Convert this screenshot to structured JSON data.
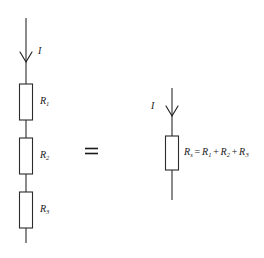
{
  "figure": {
    "ink_color": "#1a1a1a",
    "line_color": "#2b2b2b",
    "background": "#ffffff"
  },
  "left_circuit": {
    "current_label": "I",
    "resistors": [
      {
        "symbol": "R",
        "subscript": "1"
      },
      {
        "symbol": "R",
        "subscript": "2"
      },
      {
        "symbol": "R",
        "subscript": "3"
      }
    ]
  },
  "equals_sign": "=",
  "right_circuit": {
    "current_label": "I",
    "equation": {
      "lhs_symbol": "R",
      "lhs_subscript": "s",
      "relation": "=",
      "term1_symbol": "R",
      "term1_subscript": "1",
      "plus1": "+",
      "term2_symbol": "R",
      "term2_subscript": "2",
      "plus2": "+",
      "term3_symbol": "R",
      "term3_subscript": "3"
    }
  }
}
